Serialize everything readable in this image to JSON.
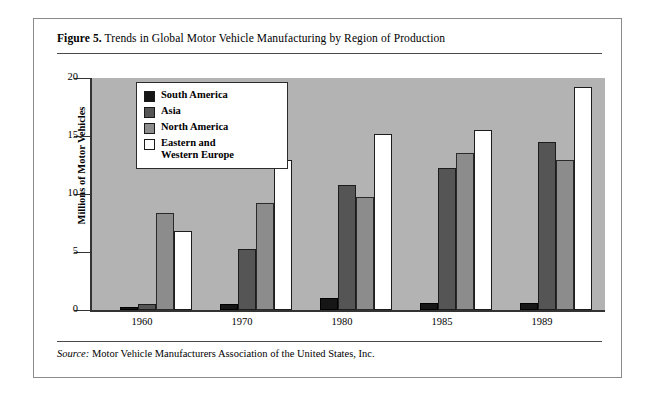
{
  "figure": {
    "number_label": "Figure 5.",
    "caption": " Trends in Global Motor Vehicle Manufacturing by Region of Production",
    "source_label": "Source:",
    "source_text": " Motor Vehicle Manufacturers Association of the United States, Inc."
  },
  "colors": {
    "south_america": "#161616",
    "asia": "#555555",
    "north_america": "#8c8c8c",
    "eastern_and_western_europe": "#ffffff",
    "plot_background": "#b3b3b3",
    "axis": "#333333",
    "frame": "#8a8a8a"
  },
  "legend": {
    "items": [
      {
        "label": "South America",
        "color": "#161616"
      },
      {
        "label": "Asia",
        "color": "#555555"
      },
      {
        "label": "North America",
        "color": "#8c8c8c"
      },
      {
        "label": "Eastern and\nWestern Europe",
        "color": "#ffffff"
      }
    ]
  },
  "axes": {
    "y_title": "Millions of Motor Vehicles",
    "y_ticks": [
      "0",
      "5",
      "10",
      "15",
      "20"
    ],
    "x_ticks": [
      "1960",
      "1970",
      "1980",
      "1985",
      "1989"
    ]
  },
  "chart_data": {
    "type": "bar",
    "title": "Trends in Global Motor Vehicle Manufacturing by Region of Production",
    "xlabel": "",
    "ylabel": "Millions of Motor Vehicles",
    "ylim": [
      0,
      20
    ],
    "yticks": [
      0,
      5,
      10,
      15,
      20
    ],
    "grid": false,
    "legend_position": "upper-left-inside",
    "categories": [
      "1960",
      "1970",
      "1980",
      "1985",
      "1989"
    ],
    "series": [
      {
        "name": "South America",
        "color": "#161616",
        "values": [
          0.3,
          0.5,
          1.0,
          0.6,
          0.6
        ]
      },
      {
        "name": "Asia",
        "color": "#555555",
        "values": [
          0.5,
          5.3,
          10.8,
          12.2,
          14.5
        ]
      },
      {
        "name": "North America",
        "color": "#8c8c8c",
        "values": [
          8.4,
          9.2,
          9.7,
          13.5,
          12.9
        ]
      },
      {
        "name": "Eastern and Western Europe",
        "color": "#ffffff",
        "values": [
          6.8,
          12.9,
          15.2,
          15.5,
          19.2
        ]
      }
    ]
  }
}
